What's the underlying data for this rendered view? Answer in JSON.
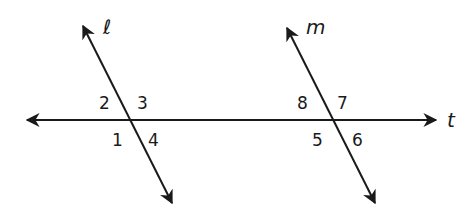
{
  "diagram": {
    "type": "parallel-lines-cut-by-transversal",
    "colors": {
      "stroke": "#1a1a1a",
      "background": "#ffffff"
    },
    "lines": {
      "l": {
        "label": "ℓ",
        "from": [
          83,
          26
        ],
        "to": [
          172,
          203
        ],
        "label_pos": [
          103,
          34
        ],
        "arrows": "both"
      },
      "m": {
        "label": "m",
        "from": [
          287,
          28
        ],
        "to": [
          375,
          203
        ],
        "label_pos": [
          306,
          34
        ],
        "arrows": "both"
      },
      "t": {
        "label": "t",
        "from": [
          27,
          120
        ],
        "to": [
          436,
          120
        ],
        "label_pos": [
          447,
          127
        ],
        "arrows": "both"
      }
    },
    "intersections": {
      "l_t": [
        129,
        120
      ],
      "m_t": [
        332,
        120
      ]
    },
    "angles": [
      {
        "label": "1",
        "pos": [
          112,
          146
        ]
      },
      {
        "label": "2",
        "pos": [
          99,
          109
        ]
      },
      {
        "label": "3",
        "pos": [
          137,
          109
        ]
      },
      {
        "label": "4",
        "pos": [
          148,
          146
        ]
      },
      {
        "label": "5",
        "pos": [
          312,
          146
        ]
      },
      {
        "label": "6",
        "pos": [
          352,
          146
        ]
      },
      {
        "label": "7",
        "pos": [
          337,
          109
        ]
      },
      {
        "label": "8",
        "pos": [
          297,
          109
        ]
      }
    ]
  }
}
